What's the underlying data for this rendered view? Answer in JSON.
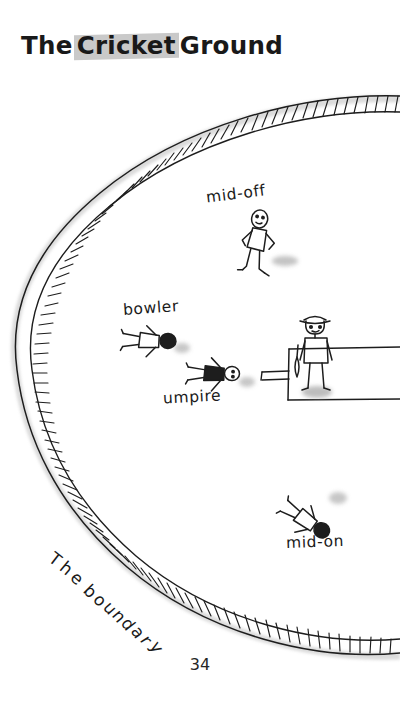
{
  "page": {
    "title_parts": [
      {
        "text": "The",
        "highlighted": false
      },
      {
        "text": "Cricket",
        "highlighted": true
      },
      {
        "text": "Ground",
        "highlighted": false
      }
    ],
    "title_full": "The Cricket Ground",
    "page_number": "34",
    "background_color": "#ffffff",
    "ink_color": "#1a1a1a",
    "highlight_color": "#c9c9c9",
    "shadow_color": "#b4b4b4"
  },
  "diagram": {
    "name": "cricket-ground-diagram",
    "style": "hand-drawn pen sketch",
    "boundary": {
      "label": "The boundary",
      "label_letters": [
        "T",
        "h",
        "e",
        " ",
        "b",
        "o",
        "u",
        "n",
        "d",
        "a",
        "r",
        "y"
      ],
      "description": "hatched arc forming the left side of an oval field boundary"
    },
    "pitch": {
      "name": "pitch-rectangle",
      "description": "rectangular pitch extending off the right edge of the page"
    },
    "figures": [
      {
        "id": "mid-off",
        "label": "mid-off",
        "role": "fielder"
      },
      {
        "id": "bowler",
        "label": "bowler",
        "role": "bowler"
      },
      {
        "id": "umpire",
        "label": "umpire",
        "role": "umpire"
      },
      {
        "id": "batsman",
        "label": "",
        "role": "batsman with hat and bat"
      },
      {
        "id": "mid-on",
        "label": "mid-on",
        "role": "fielder"
      }
    ]
  }
}
